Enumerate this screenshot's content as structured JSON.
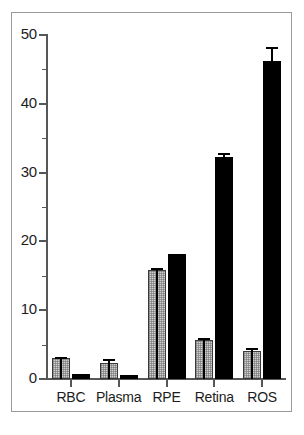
{
  "chart_data": {
    "type": "bar",
    "title": "",
    "subtitle": "",
    "xlabel": "",
    "ylabel": "",
    "categories": [
      "RBC",
      "Plasma",
      "RPE",
      "Retina",
      "ROS"
    ],
    "ylim": [
      0,
      50
    ],
    "yticks": [
      0,
      10,
      20,
      30,
      40,
      50
    ],
    "ytick_labels": [
      "0",
      "10",
      "20",
      "30",
      "40",
      "50"
    ],
    "yminor_ticks": [
      5,
      15,
      25,
      35,
      45
    ],
    "grid": false,
    "legend": null,
    "legend_position": "none",
    "series": [
      {
        "name": "gray-hatched",
        "fill": "#cfcfcf",
        "pattern": "dotted-hatch",
        "values": [
          3.0,
          2.3,
          15.8,
          5.6,
          4.0
        ],
        "errors": [
          0.15,
          0.6,
          0.4,
          0.3,
          0.45
        ]
      },
      {
        "name": "black-solid",
        "fill": "#000000",
        "pattern": "solid",
        "values": [
          0.8,
          0.6,
          18.2,
          32.2,
          46.2
        ],
        "errors": [
          0.0,
          0.0,
          0.0,
          0.7,
          2.0
        ]
      }
    ]
  },
  "axis": {
    "y_label_color": "#1c1c1c",
    "spine_color": "#575757",
    "frame_color": "#9a9a9a"
  }
}
